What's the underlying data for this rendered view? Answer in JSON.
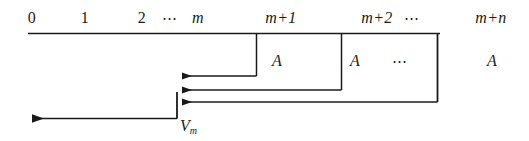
{
  "figure": {
    "type": "cash-flow-timeline-diagram",
    "stroke_color": "#1a1a1a",
    "background_color": "#ffffff"
  },
  "timeline": {
    "axis_label": "",
    "period_labels": [
      {
        "text": "0",
        "style": "upright",
        "x": 32
      },
      {
        "text": "1",
        "style": "upright",
        "x": 85
      },
      {
        "text": "2",
        "style": "upright",
        "x": 142
      },
      {
        "text": "⋯",
        "style": "dots",
        "x": 170
      },
      {
        "text": "m",
        "style": "italic",
        "x": 198
      },
      {
        "text": "m+1",
        "style": "italic",
        "x": 281
      },
      {
        "text": "m+2",
        "style": "italic",
        "x": 377
      },
      {
        "text": "⋯",
        "style": "dots",
        "x": 412
      },
      {
        "text": "m+n",
        "style": "italic",
        "x": 491
      }
    ]
  },
  "cash_flows": [
    {
      "label": "A",
      "x": 277,
      "y": 62,
      "style": "italic"
    },
    {
      "label": "A",
      "x": 355,
      "y": 62,
      "style": "italic"
    },
    {
      "label": "⋯",
      "x": 400,
      "y": 62,
      "style": "dots"
    },
    {
      "label": "A",
      "x": 492,
      "y": 62,
      "style": "italic"
    }
  ],
  "present_value": {
    "symbol": "V",
    "subscript": "m",
    "x": 180,
    "y": 120
  },
  "geometry": {
    "axis": {
      "x1": 28,
      "x2": 440,
      "y": 33
    },
    "drop_lines": [
      {
        "x": 256,
        "y1": 33,
        "y2": 76
      },
      {
        "x": 341,
        "y1": 33,
        "y2": 90
      },
      {
        "x": 437,
        "y1": 33,
        "y2": 102
      }
    ],
    "discount_arrows": [
      {
        "from_x": 256,
        "to_x": 177,
        "y": 76
      },
      {
        "from_x": 341,
        "to_x": 177,
        "y": 90
      },
      {
        "from_x": 437,
        "to_x": 177,
        "y": 102
      }
    ],
    "pv_stem": {
      "x": 177,
      "y1": 93,
      "y2": 118
    },
    "pv_arrow": {
      "from_x": 177,
      "to_x": 27,
      "y": 118
    }
  }
}
